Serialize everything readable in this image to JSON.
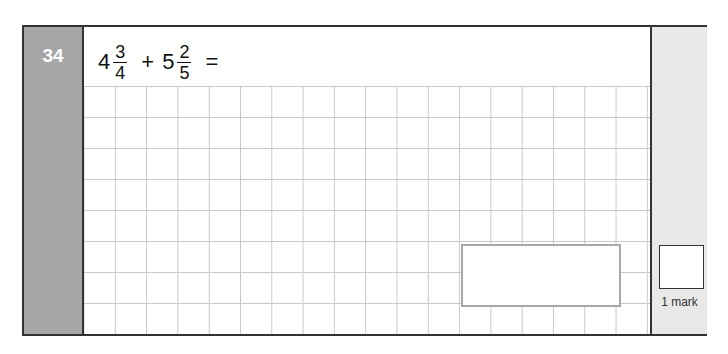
{
  "question": {
    "number": "34",
    "term1": {
      "whole": "4",
      "numerator": "3",
      "denominator": "4"
    },
    "operator": "+",
    "term2": {
      "whole": "5",
      "numerator": "2",
      "denominator": "5"
    },
    "equals": "="
  },
  "answer_box": {
    "value": ""
  },
  "marks": {
    "label": "1 mark",
    "value": ""
  },
  "colors": {
    "number_column": "#a6a6a6",
    "mark_column": "#e8e8e8",
    "grid_line": "#c8c8c8",
    "answer_border": "#a8a8a8"
  }
}
